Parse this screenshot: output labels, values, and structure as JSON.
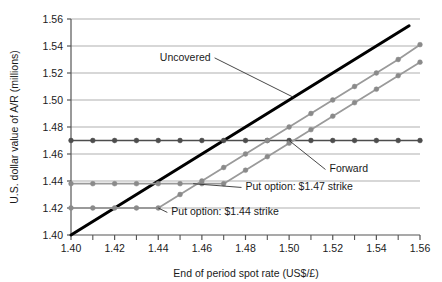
{
  "chart_data": {
    "type": "line",
    "title": "",
    "xlabel": "End of period spot rate (US$/£)",
    "ylabel": "U.S. dollar value of A/R (millions)",
    "xlim": [
      1.4,
      1.56
    ],
    "ylim": [
      1.4,
      1.56
    ],
    "xticks_major": [
      "1.40",
      "1.42",
      "1.44",
      "1.46",
      "1.48",
      "1.50",
      "1.52",
      "1.54",
      "1.56"
    ],
    "xtick_major_values": [
      1.4,
      1.42,
      1.44,
      1.46,
      1.48,
      1.5,
      1.52,
      1.54,
      1.56
    ],
    "xtick_minor_values": [
      1.41,
      1.43,
      1.45,
      1.47,
      1.49,
      1.51,
      1.53,
      1.55
    ],
    "yticks": [
      "1.40",
      "1.42",
      "1.44",
      "1.46",
      "1.48",
      "1.50",
      "1.52",
      "1.54",
      "1.56"
    ],
    "ytick_values": [
      1.4,
      1.42,
      1.44,
      1.46,
      1.48,
      1.5,
      1.52,
      1.54,
      1.56
    ],
    "grid": "horizontal",
    "legend": "annotations-inline",
    "x": [
      1.4,
      1.41,
      1.42,
      1.43,
      1.44,
      1.45,
      1.46,
      1.47,
      1.48,
      1.49,
      1.5,
      1.51,
      1.52,
      1.53,
      1.54,
      1.55,
      1.56
    ],
    "series": [
      {
        "name": "Uncovered",
        "color": "#000000",
        "width": 3.0,
        "markers": false,
        "x": [
          1.4,
          1.555
        ],
        "values": [
          1.4,
          1.555
        ]
      },
      {
        "name": "Forward",
        "color": "#4d4d4d",
        "width": 1.6,
        "markers": true,
        "marker_color": "#4d4d4d",
        "values": [
          1.47,
          1.47,
          1.47,
          1.47,
          1.47,
          1.47,
          1.47,
          1.47,
          1.47,
          1.47,
          1.47,
          1.47,
          1.47,
          1.47,
          1.47,
          1.47,
          1.47
        ]
      },
      {
        "name": "Put option: $1.47 strike",
        "color": "#9a9a9a",
        "width": 1.8,
        "markers": true,
        "marker_color": "#8a8a8a",
        "values": [
          1.438,
          1.438,
          1.438,
          1.438,
          1.438,
          1.438,
          1.438,
          1.438,
          1.448,
          1.458,
          1.468,
          1.478,
          1.488,
          1.498,
          1.508,
          1.518,
          1.528
        ]
      },
      {
        "name": "Put option: $1.44 strike",
        "color": "#9a9a9a",
        "width": 1.8,
        "markers": true,
        "marker_color": "#8a8a8a",
        "values": [
          1.42,
          1.42,
          1.42,
          1.42,
          1.42,
          1.43,
          1.44,
          1.45,
          1.46,
          1.47,
          1.48,
          1.49,
          1.5,
          1.51,
          1.52,
          1.53,
          1.541
        ]
      }
    ],
    "annotations": [
      {
        "name": "uncovered",
        "text": "Uncovered",
        "text_x": 1.464,
        "text_y": 1.529,
        "anchor": "end",
        "leader_to_x": 1.502,
        "leader_to_y": 1.502
      },
      {
        "name": "forward",
        "text": "Forward",
        "text_x": 1.5185,
        "text_y": 1.4463,
        "anchor": "start",
        "leader_to_x": 1.5,
        "leader_to_y": 1.47
      },
      {
        "name": "put-147",
        "text": "Put option: $1.47 strike",
        "text_x": 1.48,
        "text_y": 1.433,
        "anchor": "start",
        "leader_to_x": 1.456,
        "leader_to_y": 1.438
      },
      {
        "name": "put-144",
        "text": "Put option: $1.44 strike",
        "text_x": 1.446,
        "text_y": 1.4145,
        "anchor": "start",
        "leader_to_x": 1.44,
        "leader_to_y": 1.42
      }
    ]
  }
}
